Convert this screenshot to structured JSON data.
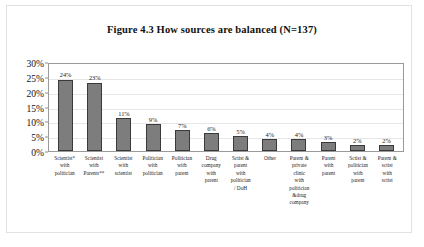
{
  "chart_data": {
    "type": "bar",
    "title": "Figure 4.3 How sources are balanced (N=137)",
    "xlabel": "",
    "ylabel": "",
    "ylim": [
      0,
      30
    ],
    "yticks": [
      "0%",
      "5%",
      "10%",
      "15%",
      "20%",
      "25%",
      "30%"
    ],
    "grid": true,
    "legend": "none",
    "value_label_suffix": "%",
    "bar_color": "#7d7d7d",
    "bar_border_color": "#3a3a3a",
    "gridline_color": "#e6e6e6",
    "plot_border_color": "#9a9a9a",
    "categories": [
      "Scientist* with politician",
      "Scientist with Parents**",
      "Scientist with scientist",
      "Politician with politician",
      "Politician with parent",
      "Drug company with parent",
      "Sctist & parent with politician / DoH",
      "Other",
      "Parent & private clinic with politician &drug company",
      "Parent with parent",
      "Sctist & politician with parent",
      "Parent & sctist with sctist"
    ],
    "category_lines": [
      [
        "Scientist*",
        "with",
        "politician"
      ],
      [
        "Scientist",
        "with",
        "Parents**"
      ],
      [
        "Scientist",
        "with",
        "scientist"
      ],
      [
        "Politician",
        "with",
        "politician"
      ],
      [
        "Politician",
        "with",
        "parent"
      ],
      [
        "Drug",
        "company",
        "with",
        "parent"
      ],
      [
        "Sctist &",
        "parent",
        "with",
        "politician",
        "/ DoH"
      ],
      [
        "Other"
      ],
      [
        "Parent &",
        "private",
        "clinic",
        "with",
        "politician",
        "&drug",
        "company"
      ],
      [
        "Parent",
        "with",
        "parent"
      ],
      [
        "Sctist &",
        "politician",
        "with",
        "parent"
      ],
      [
        "Parent &",
        "sctist",
        "with",
        "sctist"
      ]
    ],
    "values": [
      24,
      23,
      11,
      9,
      7,
      6,
      5,
      4,
      4,
      3,
      2,
      2
    ],
    "value_labels": [
      "24%",
      "23%",
      "11%",
      "9%",
      "7%",
      "6%",
      "5%",
      "4%",
      "4%",
      "3%",
      "2%",
      "2%"
    ]
  }
}
